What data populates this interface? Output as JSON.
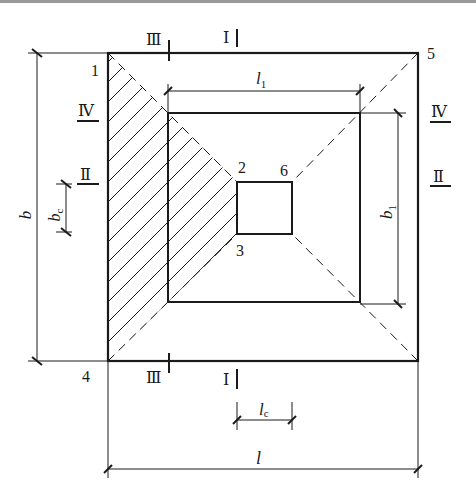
{
  "diagram": {
    "type": "foundation-plan-punching-shear",
    "colors": {
      "line": "#1a1a1a",
      "background": "#ffffff",
      "top_border": "#9a9a9a"
    },
    "points": {
      "p1": "1",
      "p2": "2",
      "p3": "3",
      "p4": "4",
      "p5": "5",
      "p6": "6"
    },
    "sections": {
      "top_III": "Ⅲ",
      "top_I": "Ⅰ",
      "bottom_III": "Ⅲ",
      "bottom_I": "Ⅰ",
      "left_IV": "Ⅳ",
      "left_II": "Ⅱ",
      "right_IV": "Ⅳ",
      "right_II": "Ⅱ"
    },
    "dimensions": {
      "b": {
        "main": "b",
        "sub": ""
      },
      "bc": {
        "main": "b",
        "sub": "c"
      },
      "l1": {
        "main": "l",
        "sub": "1"
      },
      "b1": {
        "main": "b",
        "sub": "1"
      },
      "lc": {
        "main": "l",
        "sub": "c"
      },
      "l": {
        "main": "l",
        "sub": ""
      }
    }
  }
}
